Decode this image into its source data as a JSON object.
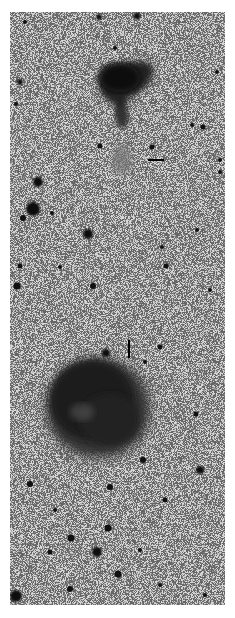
{
  "image": {
    "kind": "negative astronomical photographic plate",
    "description": "Inverted (negative) deep-sky plate showing two faint dwarf galaxies with field stars",
    "background_color": "#d6d6d6",
    "foreground_color": "#111111"
  },
  "objects": [
    {
      "name": "upper-galaxy",
      "type": "irregular dwarf galaxy",
      "cx": 113,
      "cy": 80
    },
    {
      "name": "upper-faint-extension",
      "type": "diffuse patch",
      "cx": 118,
      "cy": 160
    },
    {
      "name": "lower-galaxy",
      "type": "large diffuse dwarf galaxy",
      "cx": 98,
      "cy": 405
    }
  ],
  "markers": [
    {
      "name": "horizontal-tick-marker",
      "x1": 148,
      "y1": 160,
      "x2": 164,
      "y2": 160
    },
    {
      "name": "vertical-tick-marker",
      "x1": 129,
      "y1": 340,
      "x2": 129,
      "y2": 358
    }
  ]
}
